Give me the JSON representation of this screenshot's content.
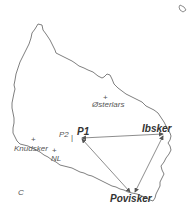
{
  "map": {
    "title": "Bornholm region map (schematic)",
    "colors": {
      "coastline": "#707070",
      "route": "#707070",
      "label": "#555555",
      "label_bold": "#333333",
      "background": "#ffffff"
    },
    "places": [
      {
        "id": "osterlars",
        "name": "Østerlars",
        "style": "regular",
        "marker": "+"
      },
      {
        "id": "knudsker",
        "name": "Knudsker",
        "style": "regular",
        "marker": "+"
      },
      {
        "id": "nl",
        "name": "NL",
        "style": "regular",
        "marker": "+"
      },
      {
        "id": "c",
        "name": "C",
        "style": "regular",
        "marker": ""
      },
      {
        "id": "p2",
        "name": "P2",
        "style": "regular",
        "marker": "|"
      },
      {
        "id": "p1",
        "name": "P1",
        "style": "bold",
        "marker": ""
      },
      {
        "id": "ibsker",
        "name": "Ibsker",
        "style": "bold",
        "marker": ""
      },
      {
        "id": "povisker",
        "name": "Povisker",
        "style": "bold",
        "marker": ""
      }
    ],
    "routes": [
      {
        "from": "P1",
        "to": "Ibsker",
        "type": "double-arrow"
      },
      {
        "from": "P1",
        "to": "Povisker",
        "type": "double-arrow"
      },
      {
        "from": "Ibsker",
        "to": "Povisker",
        "type": "double-arrow"
      }
    ],
    "islet": "small island outline (top-right)"
  }
}
